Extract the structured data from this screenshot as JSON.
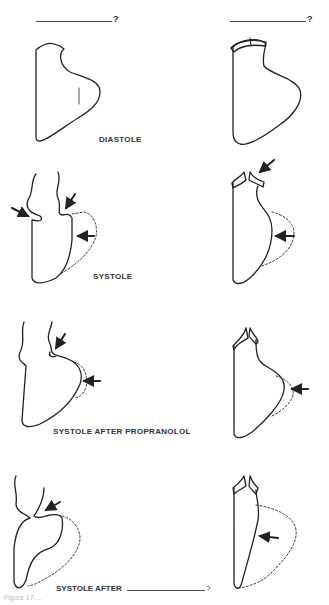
{
  "headers": {
    "left": {
      "blank_suffix": "?"
    },
    "right": {
      "blank_suffix": "?"
    }
  },
  "labels": {
    "diastole": "DIASTOLE",
    "systole": "SYSTOLE",
    "systole_propranolol": "SYSTOLE AFTER PROPRANOLOL",
    "systole_after_prefix": "SYSTOLE AFTER",
    "systole_after_suffix": "?"
  },
  "caption": "Figure 17-...",
  "colors": {
    "ink": "#222222",
    "background": "#ffffff"
  }
}
